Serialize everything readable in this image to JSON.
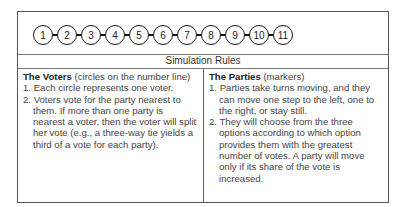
{
  "number_line": {
    "circles": [
      "1",
      "2",
      "3",
      "4",
      "5",
      "6",
      "7",
      "8",
      "9",
      "10",
      "11"
    ]
  },
  "rules_title": "Simulation Rules",
  "voters": {
    "heading": "The Voters",
    "subheading": " (circles on the number line)",
    "items": [
      "1. Each circle represents one voter.",
      "2. Voters vote for the party nearest to them. If more than one party is nearest a voter, then the voter will split her vote (e.g., a three-way tie yields a third of a vote for each party)."
    ]
  },
  "parties": {
    "heading": "The Parties",
    "subheading": " (markers)",
    "items": [
      "1. Parties take turns moving, and they can move one step to the left, one to the right, or stay still.",
      "2. They will choose from the three options according to which option provides them with the greatest number of votes. A party will move only if its share of the vote is increased."
    ]
  }
}
